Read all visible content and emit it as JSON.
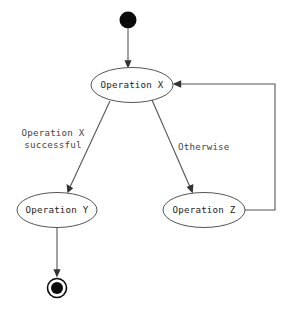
{
  "diagram": {
    "type": "uml-activity-diagram",
    "background_color": "#ffffff",
    "stroke_color": "#555555",
    "text_color": "#222222",
    "terminal_color": "#0a0a0a"
  },
  "nodes": {
    "start": {
      "name": "start-node",
      "shape": "filled-circle",
      "cx": 128,
      "cy": 20,
      "r": 8.5,
      "label": ""
    },
    "operation_x": {
      "name": "operation-x",
      "shape": "ellipse",
      "label": "Operation X",
      "cx": 132,
      "cy": 85,
      "rx": 41,
      "ry": 17.5
    },
    "operation_y": {
      "name": "operation-y",
      "shape": "ellipse",
      "label": "Operation Y",
      "cx": 57,
      "cy": 210,
      "rx": 40,
      "ry": 17.5
    },
    "operation_z": {
      "name": "operation-z",
      "shape": "ellipse",
      "label": "Operation Z",
      "cx": 204,
      "cy": 210,
      "rx": 41,
      "ry": 17.5
    },
    "end": {
      "name": "end-node",
      "shape": "bullseye",
      "cx": 57,
      "cy": 288,
      "outer_r": 9.5,
      "inner_r": 6,
      "label": ""
    }
  },
  "edges": [
    {
      "name": "edge-start-to-operation-x",
      "from": "start",
      "to": "operation_x",
      "label": "",
      "style": "straight-vertical"
    },
    {
      "name": "edge-operation-x-to-operation-y",
      "from": "operation_x",
      "to": "operation_y",
      "label": "Operation X successful",
      "label_lines": [
        "Operation X",
        "successful"
      ],
      "style": "diagonal-left"
    },
    {
      "name": "edge-operation-x-to-operation-z",
      "from": "operation_x",
      "to": "operation_z",
      "label": "Otherwise",
      "label_lines": [
        "Otherwise"
      ],
      "style": "diagonal-right"
    },
    {
      "name": "edge-operation-y-to-end",
      "from": "operation_y",
      "to": "end",
      "label": "",
      "style": "straight-vertical"
    },
    {
      "name": "edge-operation-z-to-operation-x",
      "from": "operation_z",
      "to": "operation_x",
      "label": "",
      "style": "orthogonal-loopback"
    }
  ],
  "labels": {
    "guard_successful_line1": "Operation X",
    "guard_successful_line2": "successful",
    "guard_otherwise": "Otherwise"
  }
}
